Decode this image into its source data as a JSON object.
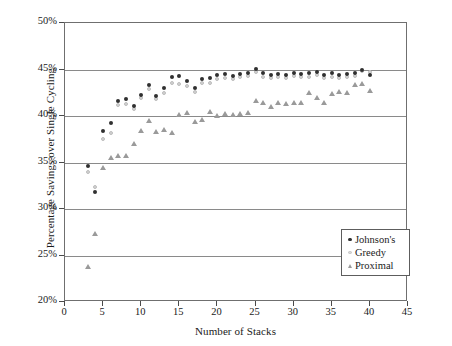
{
  "chart_data": {
    "type": "scatter",
    "title": "",
    "xlabel": "Number of Stacks",
    "ylabel": "Percentage Savings over Single Cycling",
    "xlim": [
      0,
      45
    ],
    "ylim": [
      20,
      50
    ],
    "xticks": [
      0,
      5,
      10,
      15,
      20,
      25,
      30,
      35,
      40,
      45
    ],
    "xticklabels": [
      "0",
      "5",
      "10",
      "15",
      "20",
      "25",
      "30",
      "35",
      "40",
      "45"
    ],
    "yticks": [
      20,
      25,
      30,
      35,
      40,
      45,
      50
    ],
    "yticklabels": [
      "20%",
      "25%",
      "30%",
      "35%",
      "40%",
      "45%",
      "50%"
    ],
    "grid": "horizontal",
    "legend_position": "lower-right",
    "series": [
      {
        "name": "Johnson's",
        "marker": "filled-circle",
        "color": "#303030",
        "x": [
          3,
          4,
          5,
          6,
          7,
          8,
          9,
          10,
          11,
          12,
          13,
          14,
          15,
          16,
          17,
          18,
          19,
          20,
          21,
          22,
          23,
          24,
          25,
          26,
          27,
          28,
          29,
          30,
          31,
          32,
          33,
          34,
          35,
          36,
          37,
          38,
          39,
          40
        ],
        "y": [
          34.6,
          31.8,
          38.4,
          39.3,
          41.6,
          41.8,
          41.1,
          42.3,
          43.3,
          42.2,
          43.0,
          44.2,
          44.3,
          43.8,
          43.0,
          44.0,
          44.1,
          44.4,
          44.5,
          44.3,
          44.5,
          44.6,
          45.1,
          44.6,
          44.4,
          44.5,
          44.4,
          44.6,
          44.5,
          44.6,
          44.7,
          44.4,
          44.6,
          44.4,
          44.5,
          44.6,
          44.9,
          44.4
        ]
      },
      {
        "name": "Greedy",
        "marker": "open-circle",
        "color": "#d2d2d2",
        "x": [
          3,
          4,
          5,
          6,
          7,
          8,
          9,
          10,
          11,
          12,
          13,
          14,
          15,
          16,
          17,
          18,
          19,
          20,
          21,
          22,
          23,
          24,
          25,
          26,
          27,
          28,
          29,
          30,
          31,
          32,
          33,
          34,
          35,
          36,
          37,
          38,
          39,
          40
        ],
        "y": [
          34.0,
          32.4,
          37.5,
          38.2,
          41.2,
          41.3,
          40.8,
          41.9,
          42.9,
          41.8,
          42.5,
          43.6,
          43.4,
          43.2,
          42.6,
          43.5,
          43.6,
          44.0,
          44.1,
          44.0,
          44.2,
          44.3,
          44.7,
          44.2,
          44.1,
          44.2,
          44.1,
          44.3,
          44.2,
          44.2,
          44.4,
          44.1,
          44.2,
          44.1,
          44.2,
          44.3,
          44.8,
          44.7
        ]
      },
      {
        "name": "Proximal",
        "marker": "triangle",
        "color": "#9a9a9a",
        "x": [
          3,
          4,
          5,
          6,
          7,
          8,
          9,
          10,
          11,
          12,
          13,
          14,
          15,
          16,
          17,
          18,
          19,
          20,
          21,
          22,
          23,
          24,
          25,
          26,
          27,
          28,
          29,
          30,
          31,
          32,
          33,
          34,
          35,
          36,
          37,
          38,
          39,
          40
        ],
        "y": [
          23.8,
          27.4,
          34.5,
          35.5,
          35.8,
          35.7,
          37.0,
          38.4,
          39.5,
          38.3,
          38.5,
          38.2,
          40.2,
          40.4,
          39.4,
          39.6,
          40.5,
          40.1,
          40.3,
          40.2,
          40.3,
          40.4,
          41.7,
          41.5,
          41.0,
          41.5,
          41.3,
          41.5,
          41.4,
          42.5,
          42.0,
          41.5,
          42.4,
          42.6,
          42.5,
          43.4,
          43.5,
          42.7
        ]
      }
    ]
  },
  "legend": {
    "items": [
      {
        "label": "Johnson's",
        "marker": "filled-circle"
      },
      {
        "label": "Greedy",
        "marker": "open-circle"
      },
      {
        "label": "Proximal",
        "marker": "triangle"
      }
    ]
  }
}
